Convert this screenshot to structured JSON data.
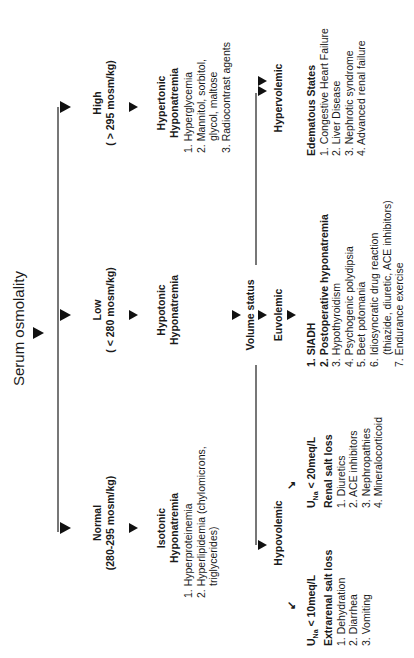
{
  "title": "Serum osmolality",
  "branches": {
    "normal": {
      "label": "Normal",
      "range": "(280-295 mosm/kg)",
      "type_line1": "Isotonic",
      "type_line2": "Hyponatremia",
      "causes": [
        "1.  Hyperproteinemia",
        "2.  Hyperlipidemia (chylomicrons,",
        "triglycerides)"
      ]
    },
    "low": {
      "label": "Low",
      "range": "( < 280 mosm/kg)",
      "type_line1": "Hypotonic",
      "type_line2": "Hyponatremia"
    },
    "high": {
      "label": "High",
      "range": "( > 295 mosm/kg)",
      "type_line1": "Hypertonic",
      "type_line2": "Hyponatremia",
      "causes": [
        "1.  Hyperglycemia",
        "2.  Mannitol, sorbitol,",
        "glycol, maltose",
        "3.  Radiocontrast agents"
      ]
    }
  },
  "volume_status": {
    "label": "Volume status",
    "hypovolemic": {
      "label": "Hypovolemic",
      "extrarenal": {
        "criterion_prefix": "U",
        "criterion_sub": "Na",
        "criterion_suffix": " < 10meq/L",
        "heading": "Extrarenal salt loss",
        "items": [
          "1.  Dehydration",
          "2.  Diarrhea",
          "3.  Vomiting"
        ]
      },
      "renal": {
        "criterion_prefix": "U",
        "criterion_sub": "Na",
        "criterion_suffix": " < 20meq/L",
        "heading": "Renal salt loss",
        "items": [
          "1.  Diuretics",
          "2.  ACE inhibitors",
          "3.  Nephropathies",
          "4.  Mineralocorticoid"
        ]
      }
    },
    "euvolemic": {
      "label": "Euvolemic",
      "items": [
        "1.  SIADH",
        "2.  Postoperative hyponatremia",
        "3.  Hypothyroidism",
        "4.  Psychogenic polydipsia",
        "5.  Beet potomania",
        "6.  Idiosyncratic drug reaction",
        "(thiazide, diuretic, ACE inhibitors)",
        "7.  Endurance exercise"
      ]
    },
    "hypervolemic": {
      "label": "Hypervolemic",
      "heading": "Edematous States",
      "items": [
        "1.  Congestive Heart Failure",
        "2.  Liver Disease",
        "3.  Nephrotic syndrome",
        "4.  Advanced renal failure"
      ]
    }
  },
  "icons": {
    "arrow": "down-triangle-arrow",
    "diag_left": "↙",
    "diag_right": "↘"
  },
  "colors": {
    "line": "#777777",
    "text": "#1a1a1a",
    "background": "#ffffff"
  }
}
